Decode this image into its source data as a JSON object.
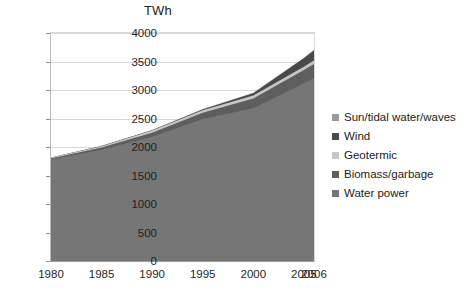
{
  "chart_data": {
    "type": "area",
    "stacked": true,
    "title": "TWh",
    "xlabel": "",
    "ylabel": "",
    "x": [
      1980,
      1985,
      1990,
      1995,
      2000,
      2005,
      2006
    ],
    "tick_labels_x": [
      "1980",
      "1985",
      "1990",
      "1995",
      "2000",
      "2005",
      "2006"
    ],
    "tick_labels_y": [
      "0",
      "500",
      "1000",
      "1500",
      "2000",
      "2500",
      "3000",
      "3500",
      "4000"
    ],
    "ylim": [
      0,
      4000
    ],
    "ytick_step": 500,
    "grid": true,
    "legend_position": "right",
    "series": [
      {
        "name": "Water power",
        "color": "#767676",
        "values": [
          1780,
          1950,
          2180,
          2490,
          2680,
          3120,
          3210
        ]
      },
      {
        "name": "Biomass/garbage",
        "color": "#5e5e5e",
        "values": [
          20,
          40,
          70,
          110,
          170,
          230,
          245
        ]
      },
      {
        "name": "Geotermic",
        "color": "#c6c6c6",
        "values": [
          15,
          25,
          40,
          45,
          55,
          60,
          62
        ]
      },
      {
        "name": "Wind",
        "color": "#4a4a4a",
        "values": [
          0,
          2,
          5,
          15,
          40,
          145,
          175
        ]
      },
      {
        "name": "Sun/tidal water/waves",
        "color": "#9a9a9a",
        "values": [
          2,
          3,
          4,
          5,
          7,
          10,
          12
        ]
      }
    ],
    "totals": [
      1817,
      2020,
      2299,
      2665,
      2952,
      3565,
      3704
    ]
  },
  "legend": {
    "items": [
      {
        "label": "Sun/tidal water/waves",
        "color": "#9a9a9a"
      },
      {
        "label": "Wind",
        "color": "#4a4a4a"
      },
      {
        "label": "Geotermic",
        "color": "#c6c6c6"
      },
      {
        "label": "Biomass/garbage",
        "color": "#5e5e5e"
      },
      {
        "label": "Water power",
        "color": "#767676"
      }
    ]
  }
}
